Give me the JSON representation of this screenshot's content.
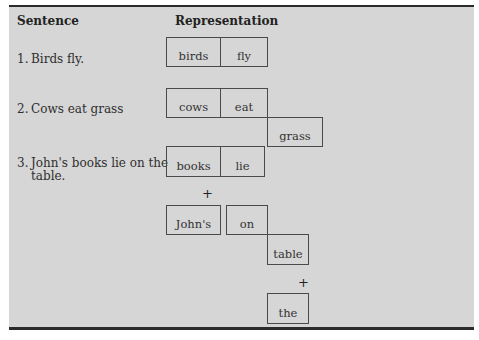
{
  "table": {
    "headers": {
      "sentence": "Sentence",
      "representation": "Representation"
    },
    "rows": [
      {
        "number": "1.",
        "sentence_line1": "Birds fly.",
        "sentence_line2": "",
        "boxes": [
          "birds",
          "fly"
        ]
      },
      {
        "number": "2.",
        "sentence_line1": "Cows eat grass",
        "sentence_line2": "",
        "boxes": [
          "cows",
          "eat",
          "grass"
        ]
      },
      {
        "number": "3.",
        "sentence_line1": "John's books lie on the",
        "sentence_line2": "table.",
        "boxes": [
          "books",
          "lie",
          "John's",
          "on",
          "table",
          "the"
        ],
        "connectors": [
          "+",
          "+"
        ]
      }
    ]
  }
}
